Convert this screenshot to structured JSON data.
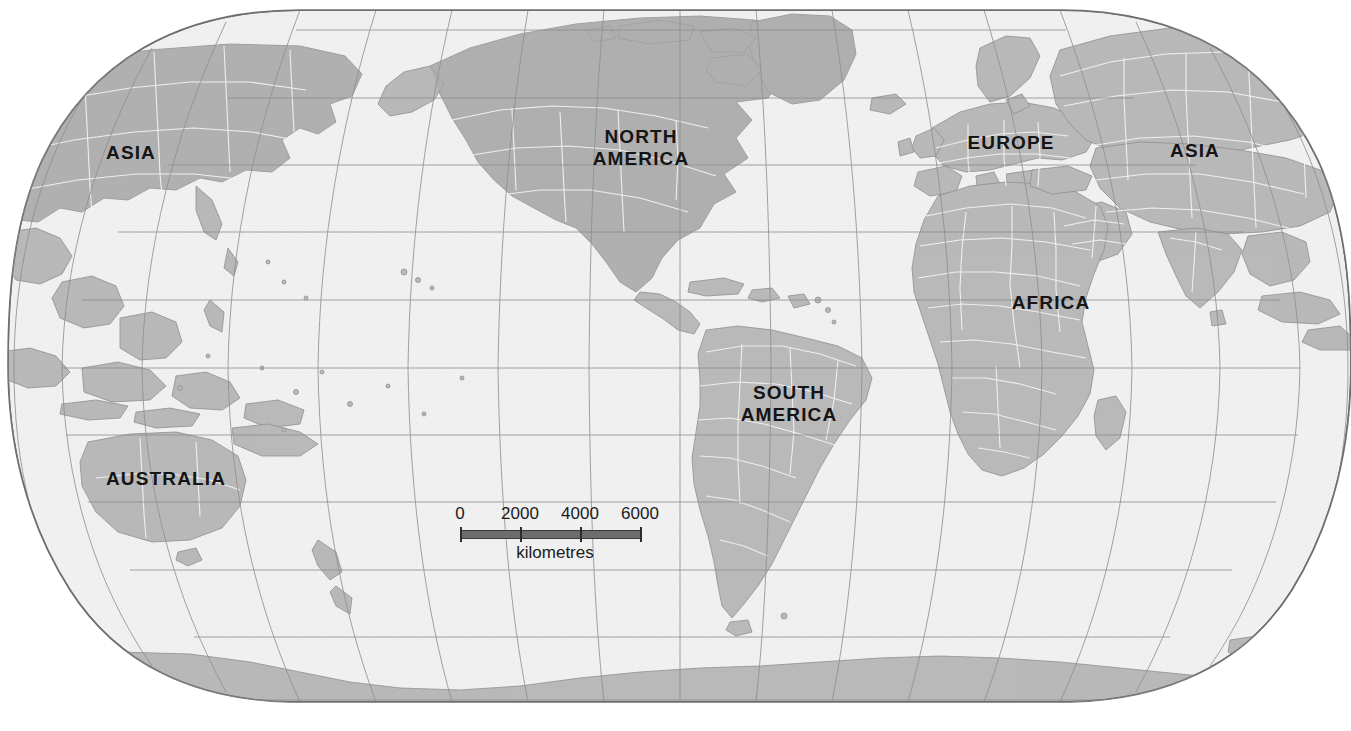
{
  "map": {
    "projection": "robinson",
    "background_color": "#ffffff",
    "ocean_color": "#f0f0f0",
    "land_color": "#b9b9b9",
    "land_color_dark": "#a9a9a9",
    "border_color": "#ffffff",
    "graticule_color": "#8d8d8d",
    "outline_color": "#6f6f6f",
    "label_color": "#151515",
    "labels": [
      {
        "id": "asia-left",
        "text": "ASIA"
      },
      {
        "id": "north-america",
        "text": "NORTH\nAMERICA"
      },
      {
        "id": "europe",
        "text": "EUROPE"
      },
      {
        "id": "asia-right",
        "text": "ASIA"
      },
      {
        "id": "africa",
        "text": "AFRICA"
      },
      {
        "id": "south-america",
        "text": "SOUTH\nAMERICA"
      },
      {
        "id": "australia",
        "text": "AUSTRALIA"
      }
    ]
  },
  "scale": {
    "caption": "kilometres",
    "unit": "km",
    "ticks": [
      "0",
      "2000",
      "4000",
      "6000"
    ],
    "tick_values": [
      0,
      2000,
      4000,
      6000
    ],
    "bar_color": "#6d6d6d"
  },
  "graticule": {
    "parallel_interval_deg": 15,
    "meridian_interval_deg": 15,
    "parallels_px": [
      30,
      98,
      165,
      232,
      300,
      368,
      435,
      502,
      570,
      637,
      700
    ],
    "visible": true
  }
}
